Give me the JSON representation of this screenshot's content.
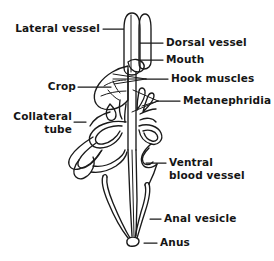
{
  "figure": {
    "background_color": "#ffffff",
    "ink_color": "#1a1a1a",
    "width": 274,
    "height": 261
  },
  "labels": {
    "lateral_vessel": "Lateral vessel",
    "dorsal_vessel": "Dorsal vessel",
    "mouth": "Mouth",
    "crop": "Crop",
    "hook_muscles": "Hook muscles",
    "metanephridia": "Metanephridia",
    "collateral_tube": "Collateral\ntube",
    "ventral_blood_vessel": "Ventral\nblood vessel",
    "anal_vesicle": "Anal vesicle",
    "anus": "Anus"
  }
}
